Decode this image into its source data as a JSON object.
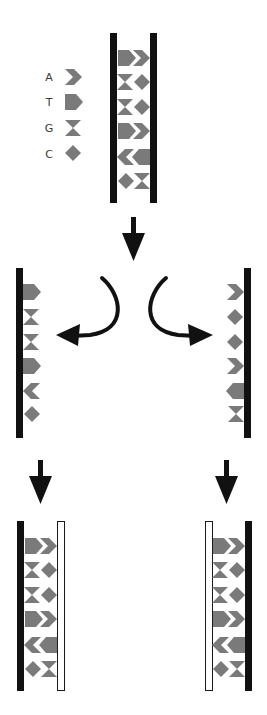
{
  "colors": {
    "strand_old": "#111111",
    "strand_new_fill": "#ffffff",
    "strand_new_stroke": "#1a1a1a",
    "base": "#7a7a7a",
    "arrow": "#111111",
    "legend_text": "#3a3a3a",
    "background": "#ffffff"
  },
  "legend": [
    {
      "letter": "A",
      "shape": "chevron-icon"
    },
    {
      "letter": "T",
      "shape": "pentagon-icon"
    },
    {
      "letter": "G",
      "shape": "hourglass-icon"
    },
    {
      "letter": "C",
      "shape": "diamond-icon"
    }
  ],
  "parent_duplex": {
    "left_strand": [
      "T",
      "G",
      "G",
      "T",
      "A",
      "C"
    ],
    "right_strand": [
      "A",
      "C",
      "C",
      "A",
      "T",
      "G"
    ]
  },
  "separated_strands": {
    "left": [
      "T",
      "G",
      "G",
      "T",
      "A",
      "C"
    ],
    "right": [
      "A",
      "C",
      "C",
      "A",
      "T",
      "G"
    ]
  },
  "daughter_duplexes": [
    {
      "old_strand": "left",
      "old": [
        "T",
        "G",
        "G",
        "T",
        "A",
        "C"
      ],
      "new": [
        "A",
        "C",
        "C",
        "A",
        "T",
        "G"
      ]
    },
    {
      "old_strand": "right",
      "old": [
        "A",
        "C",
        "C",
        "A",
        "T",
        "G"
      ],
      "new": [
        "T",
        "G",
        "G",
        "T",
        "A",
        "C"
      ]
    }
  ],
  "steps": [
    "unwind",
    "separate",
    "synthesize"
  ]
}
